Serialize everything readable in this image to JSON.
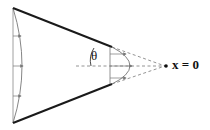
{
  "diagram": {
    "labels": {
      "angle": "θ",
      "apex": "x = 0"
    },
    "elements": [
      {
        "name": "wedge-wall-top",
        "style": "solid-thick"
      },
      {
        "name": "wedge-wall-bottom",
        "style": "solid-thick"
      },
      {
        "name": "extension-lines",
        "style": "dashed",
        "converge_to": "apex"
      },
      {
        "name": "centerline",
        "style": "dashed"
      },
      {
        "name": "inlet-velocity-profile",
        "style": "thin-arc-with-arrows",
        "arrows": 3
      },
      {
        "name": "outlet-velocity-profile",
        "style": "parabola-with-arrows",
        "arrows": 3
      },
      {
        "name": "half-angle-arc",
        "label": "θ"
      },
      {
        "name": "apex-point",
        "label": "x = 0"
      }
    ],
    "colors": {
      "wall": "#1a1a1a",
      "thin": "#777777",
      "dashed": "#888888"
    }
  }
}
